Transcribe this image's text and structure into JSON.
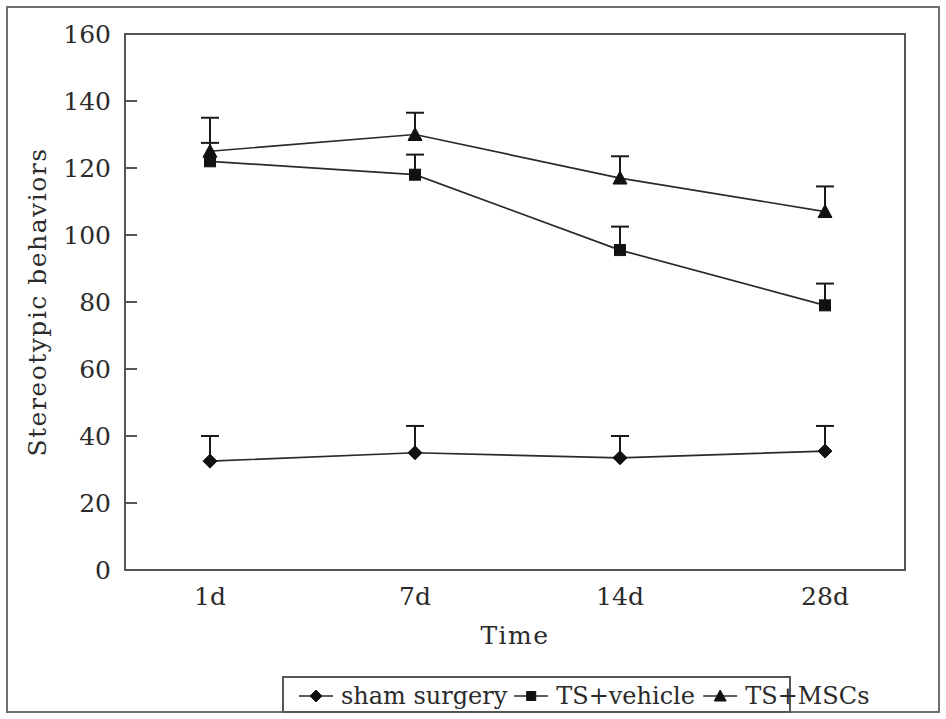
{
  "chart_data": {
    "type": "line",
    "title": "",
    "xlabel": "Time",
    "ylabel": "Stereotypic behaviors",
    "categories": [
      "1d",
      "7d",
      "14d",
      "28d"
    ],
    "xtick_labels": [
      "1d",
      "7d",
      "14d",
      "28d"
    ],
    "ytick_labels": [
      "0",
      "20",
      "40",
      "60",
      "80",
      "100",
      "120",
      "140",
      "160"
    ],
    "ytick_values": [
      0,
      20,
      40,
      60,
      80,
      100,
      120,
      140,
      160
    ],
    "ylim": [
      0,
      160
    ],
    "grid": false,
    "legend_position": "bottom-outside",
    "series": [
      {
        "name": "sham surgery",
        "marker": "diamond",
        "values": [
          32.5,
          35.0,
          33.5,
          35.5
        ],
        "errors": [
          7.5,
          8.0,
          6.5,
          7.5
        ]
      },
      {
        "name": "TS+vehicle",
        "marker": "square",
        "values": [
          122.0,
          118.0,
          95.5,
          79.0
        ],
        "errors": [
          5.5,
          6.0,
          7.0,
          6.5
        ]
      },
      {
        "name": "TS+MSCs",
        "marker": "triangle",
        "values": [
          125.0,
          130.0,
          117.0,
          107.0
        ],
        "errors": [
          10.0,
          6.5,
          6.5,
          7.5
        ]
      }
    ]
  },
  "legend": {
    "items": [
      {
        "label": "sham surgery",
        "marker": "diamond"
      },
      {
        "label": "TS+vehicle",
        "marker": "square"
      },
      {
        "label": "TS+MSCs",
        "marker": "triangle"
      }
    ]
  },
  "axes": {
    "y_title": "Stereotypic behaviors",
    "x_title": "Time"
  },
  "colors": {
    "line": "#2a2a2a",
    "marker": "#111111",
    "frame": "#6f6f6f",
    "plot_border": "#555555",
    "background": "#ffffff"
  }
}
